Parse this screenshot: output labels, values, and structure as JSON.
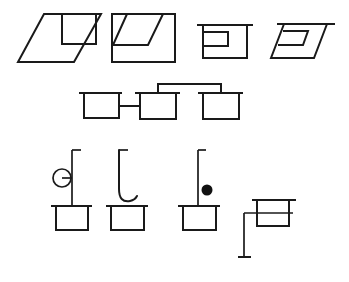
{
  "canvas": {
    "width": 349,
    "height": 282,
    "background": "#ffffff",
    "stroke_color": "#1a1a1a",
    "stroke_width": 2,
    "title": "Line drawing of eight geometric box figures"
  },
  "rows": [
    {
      "row_name": "top-row",
      "description": "Four outlined box shapes: two solid-outline variants and two open-top variants",
      "figures": [
        {
          "id": "figure-1",
          "label": "parallelogram-with-inner-rectangle",
          "description": "Sheared parallelogram containing an upright rectangle notched into its top edge"
        },
        {
          "id": "figure-2",
          "label": "rectangle-with-inner-parallelogram",
          "description": "Upright rectangle containing a sheared parallelogram notched into its top edge"
        },
        {
          "id": "figure-3",
          "label": "open-rectangle-with-inner-rectangle",
          "description": "Rectangle with overhanging top bar and a small rectangle attached to the left wall"
        },
        {
          "id": "figure-4",
          "label": "open-parallelogram-with-inner-parallelogram",
          "description": "Parallelogram with overhanging top bar and a small parallelogram attached to the left wall"
        }
      ]
    },
    {
      "row_name": "middle-row",
      "description": "Three open-top boxes linked by connector lines",
      "figures": [
        {
          "id": "figure-5",
          "label": "linked-box-left",
          "description": "Open-top box joined rightward by a straight connector"
        },
        {
          "id": "figure-6",
          "label": "linked-box-center",
          "description": "Open-top box joined left by a straight connector and upward by a bracket connector"
        },
        {
          "id": "figure-7",
          "label": "linked-box-right",
          "description": "Open-top box joined by a bracket connector arriving from above"
        }
      ]
    },
    {
      "row_name": "bottom-row",
      "description": "Four open-top boxes with vertical stems carrying different terminals",
      "figures": [
        {
          "id": "figure-8",
          "label": "box-with-circle-stem",
          "description": "Open-top box with vertical stem, flag tick at top, and a circle terminal spurred off the left of the stem"
        },
        {
          "id": "figure-9",
          "label": "box-with-hook-stem",
          "description": "Open-top box with vertical stem ending in a J-shaped hook curve above the box rim"
        },
        {
          "id": "figure-10",
          "label": "box-with-dot-stem",
          "description": "Open-top box with plain vertical stem and a filled black dot beside it"
        },
        {
          "id": "figure-11",
          "label": "rotated-box-with-stem",
          "description": "Open-top box rotated so its stem exits leftward then turns down to a terminal tick"
        }
      ]
    }
  ],
  "geometry": {
    "figure_1": {
      "outer_polygon": "44,14 101,14 74,62 18,62",
      "inner_path": "62,14 62,44 96,44 96,14"
    },
    "figure_2": {
      "outer_rect": "112,14 175,14 175,62 112,62",
      "inner_path": "127,14 113,45 148,45 163,14"
    },
    "figure_3": {
      "top_bar": "197,25 253,25",
      "body_path": "203,25 203,58 247,58 247,25",
      "inner_path": "203,32 228,32 228,46 203,46"
    },
    "figure_4": {
      "top_bar": "277,24 335,24",
      "body_path": "284,24 271,58 314,58 327,24",
      "inner_path": "283,31 308,31 303,45 278,45"
    },
    "figure_5": {
      "top_bar": "79,93 122,93",
      "body_path": "84,93 84,118 119,118 119,93"
    },
    "figure_6": {
      "top_bar": "135,93 180,93",
      "body_path": "140,93 140,119 176,119 176,93"
    },
    "figure_7": {
      "top_bar": "198,93 243,93",
      "body_path": "203,93 203,119 239,119 239,93"
    },
    "connectors": {
      "straight": "119,106 140,106",
      "bracket": "158,93 158,84 221,84 221,93"
    },
    "figure_8": {
      "top_bar": "51,206 92,206",
      "body_path": "56,206 56,230 88,230 88,206",
      "stem": "72,150 72,206",
      "flag_tick": "72,150 80,150",
      "circle_center": "62,178",
      "circle_r": "9",
      "spur": "62,178 72,178"
    },
    "figure_9": {
      "top_bar": "106,206 148,206",
      "body_path": "111,206 111,230 144,230 144,206",
      "stem_hook": "119,150 119,190 Q119,204 132,200",
      "flag_tick": "119,150 127,150"
    },
    "figure_10": {
      "top_bar": "178,206 220,206",
      "body_path": "183,206 183,230 216,230 216,206",
      "stem": "198,150 198,206",
      "dot_center": "207,190",
      "dot_r": "5"
    },
    "figure_11": {
      "top_bar": "252,200 296,200",
      "inner_line": "244,213 293,213",
      "body_path": "257,200 257,226 289,226 289,200",
      "stem": "244,213 244,257",
      "flag_tick": "238,257 250,257"
    }
  }
}
